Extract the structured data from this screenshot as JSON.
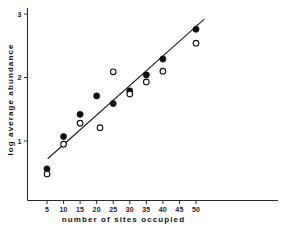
{
  "chart_data": {
    "type": "scatter",
    "title": "",
    "xlabel": "number  of  sites  occupied",
    "ylabel": "log  average  abundance",
    "xlim": [
      2,
      55
    ],
    "ylim": [
      0.12,
      3.22
    ],
    "xticks": [
      5,
      10,
      15,
      20,
      25,
      30,
      35,
      40,
      45,
      50
    ],
    "xtick_labels": [
      "5",
      "10",
      "15",
      "20",
      "25",
      "30",
      "35",
      "40",
      "45",
      "50"
    ],
    "yticks": [
      1,
      2,
      3
    ],
    "ytick_labels": [
      "1",
      "2",
      "3"
    ],
    "grid": false,
    "legend": "none",
    "series": [
      {
        "name": "filled-circles",
        "marker": "filled-circle",
        "color": "#111111",
        "points": [
          {
            "x": 5,
            "y": 0.56
          },
          {
            "x": 10,
            "y": 1.07
          },
          {
            "x": 15,
            "y": 1.42
          },
          {
            "x": 20,
            "y": 1.71
          },
          {
            "x": 25,
            "y": 1.59
          },
          {
            "x": 30,
            "y": 1.79
          },
          {
            "x": 35,
            "y": 2.04
          },
          {
            "x": 40,
            "y": 2.29
          },
          {
            "x": 50,
            "y": 2.76
          }
        ]
      },
      {
        "name": "open-circles",
        "marker": "open-circle",
        "color": "#ffffff",
        "points": [
          {
            "x": 5,
            "y": 0.48
          },
          {
            "x": 10,
            "y": 0.95
          },
          {
            "x": 15,
            "y": 1.28
          },
          {
            "x": 21,
            "y": 1.21
          },
          {
            "x": 25,
            "y": 2.09
          },
          {
            "x": 30,
            "y": 1.74
          },
          {
            "x": 35,
            "y": 1.93
          },
          {
            "x": 40,
            "y": 2.1
          },
          {
            "x": 50,
            "y": 2.54
          }
        ]
      }
    ],
    "fit_line": {
      "name": "regression-line",
      "x_start": 5.2,
      "y_start": 0.72,
      "x_end": 52.5,
      "y_end": 2.92,
      "color": "#1a1a1a"
    }
  }
}
